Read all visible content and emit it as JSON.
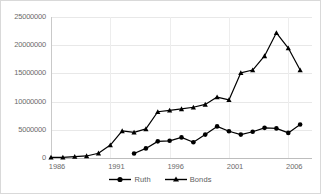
{
  "chart_data": {
    "type": "line",
    "title": "",
    "xlabel": "",
    "ylabel": "",
    "ylim": [
      0,
      25000000
    ],
    "xlim": [
      1986,
      2008
    ],
    "grid": true,
    "legend_position": "bottom",
    "y_ticks": [
      "0",
      "5000000",
      "10000000",
      "15000000",
      "20000000",
      "25000000"
    ],
    "y_tick_values": [
      0,
      5000000,
      10000000,
      15000000,
      20000000,
      25000000
    ],
    "x_ticks": [
      "1986",
      "1991",
      "1996",
      "2001",
      "2006"
    ],
    "x_tick_values": [
      1986,
      1991,
      1996,
      2001,
      2006
    ],
    "series": [
      {
        "name": "Ruth",
        "marker": "circle",
        "color": "#000000",
        "x": [
          1993,
          1994,
          1995,
          1996,
          1997,
          1998,
          1999,
          2000,
          2001,
          2002,
          2003,
          2004,
          2005,
          2006,
          2007
        ],
        "values": [
          800000,
          1700000,
          2950000,
          3050000,
          3650000,
          2800000,
          4150000,
          5600000,
          4750000,
          4150000,
          4650000,
          5350000,
          5250000,
          4450000,
          5950000
        ]
      },
      {
        "name": "Bonds",
        "marker": "triangle",
        "color": "#000000",
        "x": [
          1986,
          1987,
          1988,
          1989,
          1990,
          1991,
          1992,
          1993,
          1994,
          1995,
          1996,
          1997,
          1998,
          1999,
          2000,
          2001,
          2002,
          2003,
          2004,
          2005,
          2006,
          2007
        ],
        "values": [
          110000,
          120000,
          240000,
          360000,
          850000,
          2300000,
          4800000,
          4550000,
          5150000,
          8200000,
          8450000,
          8700000,
          9000000,
          9500000,
          10800000,
          10300000,
          15100000,
          15600000,
          18100000,
          22200000,
          19500000,
          15600000
        ]
      }
    ]
  },
  "legend": {
    "items": [
      {
        "label": "Ruth",
        "marker": "circle"
      },
      {
        "label": "Bonds",
        "marker": "triangle"
      }
    ]
  },
  "clipped_title": ""
}
